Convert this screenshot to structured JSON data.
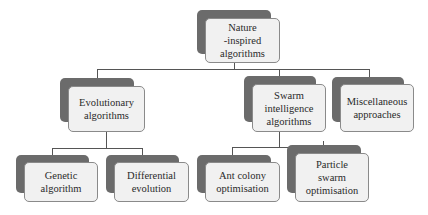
{
  "diagram": {
    "type": "hierarchy",
    "colors": {
      "shadow": "#6b6b6b",
      "fill": "#f1f1f1",
      "border": "#8a8a8a",
      "connector": "#555555"
    },
    "root": {
      "label": "Nature\n-inspired\nalgorithms"
    },
    "level1": [
      {
        "label": "Evolutionary\nalgorithms"
      },
      {
        "label": "Swarm\nintelligence\nalgorithms"
      },
      {
        "label": "Miscellaneous\napproaches"
      }
    ],
    "level2": [
      {
        "label": "Genetic\nalgorithm",
        "parent": "Evolutionary algorithms"
      },
      {
        "label": "Differential\nevolution",
        "parent": "Evolutionary algorithms"
      },
      {
        "label": "Ant colony\noptimisation",
        "parent": "Swarm intelligence algorithms"
      },
      {
        "label": "Particle\nswarm\noptimisation",
        "parent": "Swarm intelligence algorithms"
      }
    ]
  }
}
